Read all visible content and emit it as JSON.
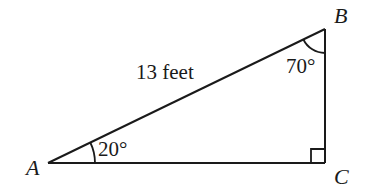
{
  "diagram": {
    "type": "right-triangle",
    "stroke_color": "#1a1a1a",
    "background": "#ffffff",
    "vertices": {
      "A": {
        "label": "A",
        "x": 48,
        "y": 163
      },
      "B": {
        "label": "B",
        "x": 325,
        "y": 29
      },
      "C": {
        "label": "C",
        "x": 325,
        "y": 163
      }
    },
    "sides": {
      "AB": {
        "label": "13 feet",
        "role": "hypotenuse"
      }
    },
    "angles": {
      "A": {
        "label": "20°",
        "value": 20
      },
      "B": {
        "label": "70°",
        "value": 70
      },
      "C": {
        "label": "",
        "value": 90,
        "marker": "right-angle-square"
      }
    }
  }
}
